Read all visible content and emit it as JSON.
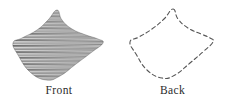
{
  "figure": {
    "background_color": "#ffffff",
    "ink_color": "#3a3a3a",
    "caption_color": "#2b2b2b"
  },
  "panels": [
    {
      "id": "front",
      "caption": "Front",
      "render_style": "horizontal-hatch-fill",
      "stroke_color": "#3a3a3a",
      "hatch_spacing_px": 2,
      "hatch_line_width_px": 1,
      "outline_dashed": false
    },
    {
      "id": "back",
      "caption": "Back",
      "render_style": "dashed-outline",
      "stroke_color": "#555555",
      "dash_pattern": "4 3",
      "outline_dashed": true,
      "line_width_px": 1.1
    }
  ],
  "chart_data": {
    "type": "line",
    "title": "",
    "subtitle": "",
    "xlabel": "",
    "ylabel": "",
    "grid": false,
    "legend_position": "below",
    "annotations": [
      "Front",
      "Back"
    ],
    "series": [
      {
        "name": "Front",
        "closed": true,
        "x": [
          57,
          62,
          72,
          86,
          98,
          103,
          92,
          76,
          60,
          46,
          30,
          18,
          13,
          22,
          37,
          48
        ],
        "y": [
          10,
          20,
          29,
          35,
          39,
          43,
          52,
          64,
          76,
          80,
          72,
          55,
          43,
          38,
          30,
          20
        ]
      },
      {
        "name": "Back",
        "closed": true,
        "x": [
          173,
          178,
          188,
          201,
          210,
          213,
          204,
          190,
          175,
          162,
          147,
          136,
          130,
          139,
          152,
          164
        ],
        "y": [
          9,
          19,
          28,
          34,
          38,
          42,
          51,
          63,
          75,
          78,
          70,
          54,
          42,
          37,
          29,
          19
        ]
      }
    ],
    "xlim": [
      0,
      227
    ],
    "ylim": [
      0,
      109
    ]
  }
}
